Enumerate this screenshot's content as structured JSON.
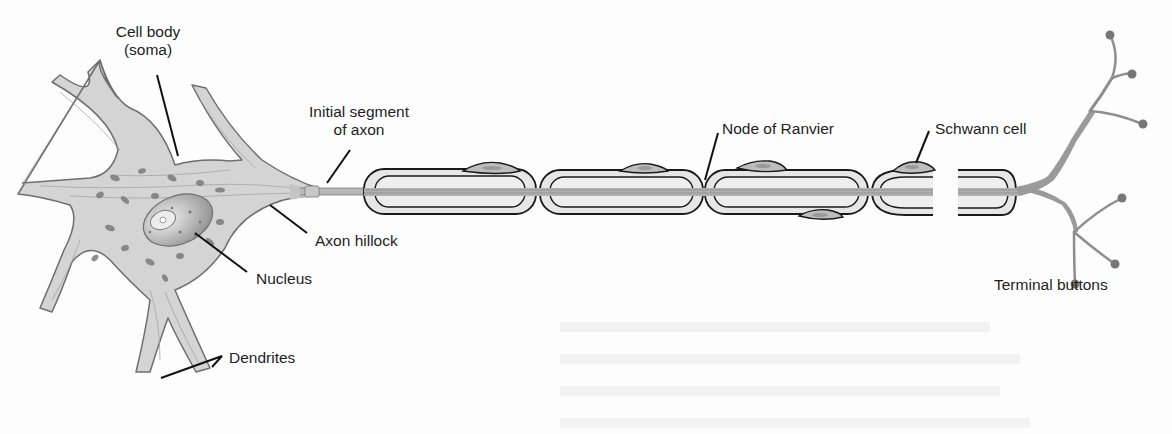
{
  "diagram": {
    "labels": {
      "cell_body_line1": "Cell body",
      "cell_body_line2": "(soma)",
      "initial_segment_line1": "Initial segment",
      "initial_segment_line2": "of axon",
      "axon_hillock": "Axon hillock",
      "nucleus": "Nucleus",
      "dendrites": "Dendrites",
      "node_of_ranvier": "Node of Ranvier",
      "schwann_cell": "Schwann cell",
      "terminal_buttons": "Terminal buttons"
    },
    "colors": {
      "background": "#fdfdfd",
      "cell_fill": "#d4d4d4",
      "cell_outline": "#6e6e6e",
      "myelin_fill": "#e6e6e6",
      "myelin_outline": "#1a1a1a",
      "schwann_fill": "#bdbdbd",
      "nucleus_fill": "#a9a9a9",
      "organelle": "#777777",
      "label_text": "#1e1e1e",
      "leader_line": "#111111"
    }
  }
}
